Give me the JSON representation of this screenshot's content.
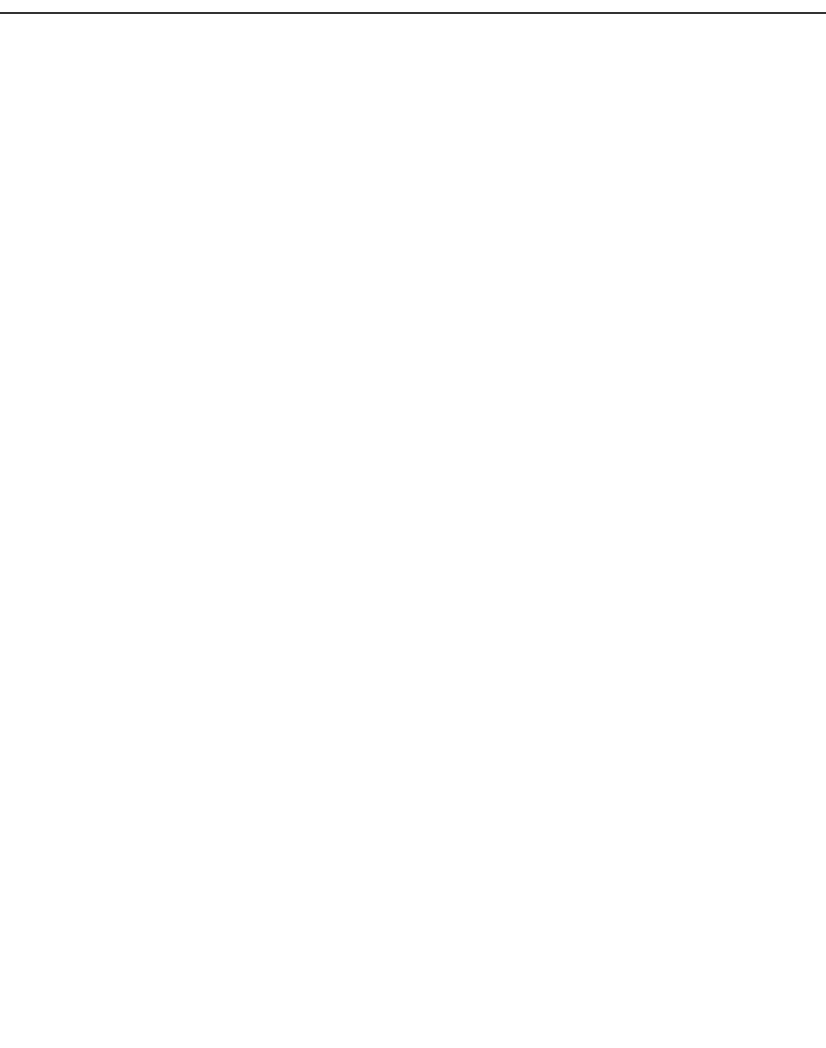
{
  "header": {
    "rule": true
  },
  "chart_data": [
    {
      "type": "line",
      "panel": "top",
      "title": "Protopterus annectens Hb",
      "title_italic_part": "Protopterus annectens",
      "title_plain_part": "Hb",
      "subtitle": "25°C, 0.1 M HEPES buffer",
      "xlabel": "pH",
      "ylabel": "log [P50 (mmHg)]",
      "ylabel_parts": {
        "prefix": "10g [P",
        "sub": "50",
        "suffix": " (mmHg) ]"
      },
      "ylabel_right": "P50 (mmHg)",
      "ylabel_right_parts": {
        "prefix": "P",
        "sub": "50",
        "suffix": " (mmHg)"
      },
      "xlim": [
        7.0,
        7.8
      ],
      "ylim": [
        0.303,
        1.5
      ],
      "yticks_left": [
        "0.5",
        "1.0",
        "1.5"
      ],
      "yticks_left_values": [
        0.5,
        1.0,
        1.5
      ],
      "yticks_right": [
        "2",
        "3",
        "4",
        "5",
        "10",
        "15",
        "20",
        "25",
        "30"
      ],
      "yticks_right_values": [
        2,
        3,
        4,
        5,
        10,
        15,
        20,
        25,
        30
      ],
      "grid": false,
      "legend_position": "lower-center",
      "series": [
        {
          "name": "stripped",
          "marker": "open-circle",
          "x": [
            7.11,
            7.72
          ],
          "y": [
            0.69,
            0.69
          ]
        },
        {
          "name": "0.1M KCl",
          "marker": "open-triangle-down",
          "x": [
            7.13,
            7.73
          ],
          "y": [
            1.0,
            0.65
          ]
        },
        {
          "name": "B3 peptide",
          "marker": "open-square",
          "x": [
            7.11,
            7.68
          ],
          "y": [
            0.75,
            0.67
          ]
        },
        {
          "name": "ATP",
          "marker": "filled-circle",
          "x": [
            7.1,
            7.7
          ],
          "y": [
            1.26,
            0.83
          ]
        },
        {
          "name": "GTP",
          "marker": "filled-diamond",
          "x": [
            7.12,
            7.7
          ],
          "y": [
            1.25,
            0.89
          ]
        }
      ]
    },
    {
      "type": "scatter",
      "panel": "bottom",
      "xlabel": "pH",
      "ylabel": "",
      "xlim": [
        7.0,
        7.8
      ],
      "ylim": [
        0,
        3.5
      ],
      "xticks": [
        "7.0",
        "7.2",
        "7.4",
        "7.6",
        "7.8"
      ],
      "xticks_values": [
        7.0,
        7.2,
        7.4,
        7.6,
        7.8
      ],
      "yticks": [
        "0",
        "1",
        "2",
        "3"
      ],
      "yticks_values": [
        0,
        1,
        2,
        3
      ],
      "grid": false,
      "series": [
        {
          "name": "stripped",
          "marker": "open-circle",
          "x": [
            7.11,
            7.71
          ],
          "y": [
            1.3,
            1.3
          ]
        },
        {
          "name": "0.1M KCl",
          "marker": "open-triangle-down",
          "x": [
            7.13,
            7.72
          ],
          "y": [
            1.25,
            1.65
          ]
        },
        {
          "name": "B3 peptide",
          "marker": "open-diamond",
          "x": [
            7.11,
            7.68
          ],
          "y": [
            1.55,
            1.6
          ]
        },
        {
          "name": "ATP",
          "marker": "filled-circle",
          "x": [
            7.1,
            7.7
          ],
          "y": [
            1.45,
            1.9
          ]
        },
        {
          "name": "GTP",
          "marker": "filled-diamond",
          "x": [
            7.12,
            7.68
          ],
          "y": [
            1.45,
            1.6
          ]
        },
        {
          "name": "unlabeled",
          "marker": "half-circle",
          "x": [
            7.15
          ],
          "y": [
            2.0
          ]
        }
      ]
    }
  ],
  "legend": {
    "items": [
      {
        "label": "stripped",
        "marker": "open-circle"
      },
      {
        "label": "0.1M KCl",
        "marker": "open-triangle-down"
      },
      {
        "label": "B3 peptide",
        "marker": "open-square"
      },
      {
        "label": "ATP",
        "marker": "filled-circle"
      },
      {
        "label": "GTP",
        "marker": "filled-diamond"
      }
    ]
  },
  "colors": {
    "ink": "#1a1a1a",
    "background": "#ffffff"
  }
}
